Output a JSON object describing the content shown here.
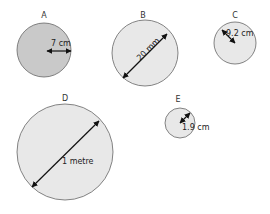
{
  "colors": {
    "stroke": "#555555",
    "fill_light": "#e8e8e8",
    "fill_dark": "#c8c8c8",
    "arrow": "#111111"
  },
  "circles": [
    {
      "label": "A",
      "measurement": "7 cm",
      "type": "radius"
    },
    {
      "label": "B",
      "measurement": "20 mm",
      "type": "diameter"
    },
    {
      "label": "C",
      "measurement": "9.2 cm",
      "type": "radius"
    },
    {
      "label": "D",
      "measurement": "1 metre",
      "type": "diameter"
    },
    {
      "label": "E",
      "measurement": "1.9 cm",
      "type": "radius"
    }
  ]
}
